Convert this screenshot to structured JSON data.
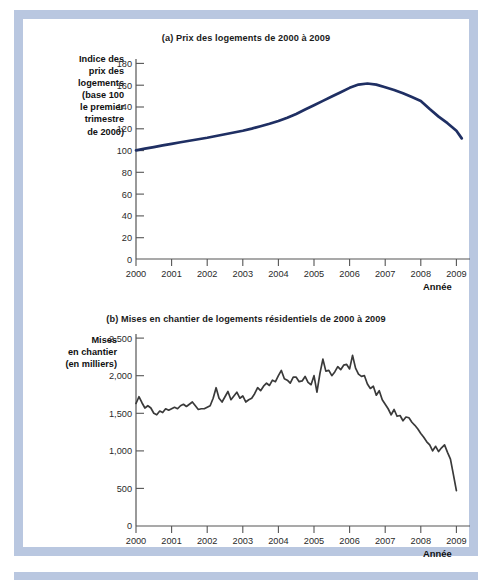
{
  "figure": {
    "frame_color": "#b9c7e0",
    "background": "#ffffff"
  },
  "panel_a": {
    "title": "(a) Prix des logements de 2000 à 2009",
    "ylabel": "Indice des\nprix des\nlogements\n(base 100\nle premier\ntrimestre\nde 2000)",
    "xaxis_title": "Année",
    "line_color": "#1f2f63"
  },
  "panel_b": {
    "title": "(b) Mises en chantier de logements résidentiels de 2000 à 2009",
    "ylabel": "Mises\nen chantier\n(en milliers)",
    "xaxis_title": "Année",
    "line_color": "#3a3a3a"
  },
  "chart_data": [
    {
      "type": "line",
      "id": "panel_a",
      "title": "(a) Prix des logements de 2000 à 2009",
      "xlabel": "Année",
      "ylabel": "Indice des prix des logements (base 100 le premier trimestre de 2000)",
      "xlim": [
        2000,
        2009.25
      ],
      "ylim": [
        0,
        190
      ],
      "yticks": [
        0,
        20,
        40,
        60,
        80,
        100,
        120,
        140,
        160,
        180
      ],
      "ytick_labels": [
        "0",
        "20",
        "40",
        "60",
        "80",
        "100",
        "120",
        "140",
        "160",
        "180"
      ],
      "xticks": [
        2000,
        2001,
        2002,
        2003,
        2004,
        2005,
        2006,
        2007,
        2008,
        2009
      ],
      "xtick_labels": [
        "2000",
        "2001",
        "2002",
        "2003",
        "2004",
        "2005",
        "2006",
        "2007",
        "2008",
        "2009"
      ],
      "grid": false,
      "legend": null,
      "series": [
        {
          "name": "Indice des prix des logements",
          "color": "#1f2f63",
          "x": [
            2000.0,
            2000.25,
            2000.5,
            2000.75,
            2001.0,
            2001.25,
            2001.5,
            2001.75,
            2002.0,
            2002.25,
            2002.5,
            2002.75,
            2003.0,
            2003.25,
            2003.5,
            2003.75,
            2004.0,
            2004.25,
            2004.5,
            2004.75,
            2005.0,
            2005.25,
            2005.5,
            2005.75,
            2006.0,
            2006.25,
            2006.5,
            2006.75,
            2007.0,
            2007.25,
            2007.5,
            2007.75,
            2008.0,
            2008.25,
            2008.5,
            2008.75,
            2009.0,
            2009.15
          ],
          "values": [
            100.0,
            101.5,
            103.0,
            104.5,
            106.0,
            107.4,
            108.8,
            110.2,
            111.6,
            113.2,
            114.8,
            116.4,
            118.0,
            120.0,
            122.2,
            124.5,
            127.0,
            130.0,
            133.5,
            137.5,
            141.5,
            145.5,
            149.5,
            153.5,
            157.5,
            160.5,
            161.5,
            160.5,
            158.0,
            155.5,
            152.5,
            149.0,
            145.5,
            138.0,
            131.0,
            125.0,
            118.0,
            111.0
          ]
        }
      ]
    },
    {
      "type": "line",
      "id": "panel_b",
      "title": "(b) Mises en chantier de logements résidentiels de 2000 à 2009",
      "xlabel": "Année",
      "ylabel": "Mises en chantier (en milliers)",
      "xlim": [
        2000,
        2009.25
      ],
      "ylim": [
        0,
        2650
      ],
      "yticks": [
        0,
        500,
        1000,
        1500,
        2000,
        2500
      ],
      "ytick_labels": [
        "0",
        "500",
        "1,000",
        "1,500",
        "2,000",
        "2,500"
      ],
      "xticks": [
        2000,
        2001,
        2002,
        2003,
        2004,
        2005,
        2006,
        2007,
        2008,
        2009
      ],
      "xtick_labels": [
        "2000",
        "2001",
        "2002",
        "2003",
        "2004",
        "2005",
        "2006",
        "2007",
        "2008",
        "2009"
      ],
      "grid": false,
      "legend": null,
      "series": [
        {
          "name": "Mises en chantier de logements résidentiels",
          "color": "#3a3a3a",
          "x": [
            2000.0,
            2000.083,
            2000.167,
            2000.25,
            2000.333,
            2000.417,
            2000.5,
            2000.583,
            2000.667,
            2000.75,
            2000.833,
            2000.917,
            2001.0,
            2001.083,
            2001.167,
            2001.25,
            2001.333,
            2001.417,
            2001.5,
            2001.583,
            2001.667,
            2001.75,
            2001.833,
            2001.917,
            2002.0,
            2002.083,
            2002.167,
            2002.25,
            2002.333,
            2002.417,
            2002.5,
            2002.583,
            2002.667,
            2002.75,
            2002.833,
            2002.917,
            2003.0,
            2003.083,
            2003.167,
            2003.25,
            2003.333,
            2003.417,
            2003.5,
            2003.583,
            2003.667,
            2003.75,
            2003.833,
            2003.917,
            2004.0,
            2004.083,
            2004.167,
            2004.25,
            2004.333,
            2004.417,
            2004.5,
            2004.583,
            2004.667,
            2004.75,
            2004.833,
            2004.917,
            2005.0,
            2005.083,
            2005.167,
            2005.25,
            2005.333,
            2005.417,
            2005.5,
            2005.583,
            2005.667,
            2005.75,
            2005.833,
            2005.917,
            2006.0,
            2006.083,
            2006.167,
            2006.25,
            2006.333,
            2006.417,
            2006.5,
            2006.583,
            2006.667,
            2006.75,
            2006.833,
            2006.917,
            2007.0,
            2007.083,
            2007.167,
            2007.25,
            2007.333,
            2007.417,
            2007.5,
            2007.583,
            2007.667,
            2007.75,
            2007.833,
            2007.917,
            2008.0,
            2008.083,
            2008.167,
            2008.25,
            2008.333,
            2008.417,
            2008.5,
            2008.583,
            2008.667,
            2008.75,
            2008.833,
            2008.917,
            2009.0,
            2009.083,
            2009.167
          ],
          "values": [
            1630,
            1720,
            1640,
            1570,
            1600,
            1570,
            1500,
            1480,
            1530,
            1510,
            1560,
            1540,
            1560,
            1580,
            1560,
            1600,
            1620,
            1590,
            1620,
            1650,
            1600,
            1550,
            1560,
            1560,
            1580,
            1600,
            1700,
            1840,
            1700,
            1650,
            1720,
            1790,
            1680,
            1730,
            1780,
            1700,
            1730,
            1650,
            1680,
            1700,
            1760,
            1840,
            1800,
            1860,
            1900,
            1870,
            1940,
            1920,
            2000,
            2070,
            1960,
            1940,
            1900,
            1980,
            1980,
            1920,
            1930,
            1990,
            1910,
            1880,
            2000,
            1780,
            2030,
            2220,
            2060,
            2070,
            2000,
            2050,
            2120,
            2080,
            2140,
            2150,
            2090,
            2270,
            2100,
            2020,
            1990,
            2000,
            1890,
            1830,
            1860,
            1740,
            1800,
            1680,
            1620,
            1560,
            1480,
            1550,
            1460,
            1470,
            1400,
            1450,
            1440,
            1380,
            1340,
            1290,
            1230,
            1180,
            1120,
            1080,
            1000,
            1060,
            990,
            1040,
            1080,
            980,
            890,
            680,
            470
          ]
        }
      ]
    }
  ]
}
